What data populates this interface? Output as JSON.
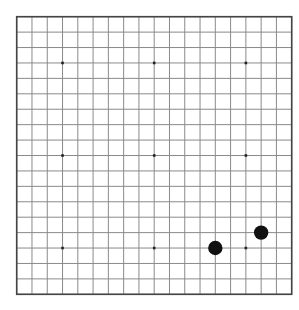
{
  "game": {
    "type": "go",
    "board_size": 19,
    "star_points": [
      [
        3,
        3
      ],
      [
        9,
        3
      ],
      [
        15,
        3
      ],
      [
        3,
        9
      ],
      [
        9,
        9
      ],
      [
        15,
        9
      ],
      [
        3,
        15
      ],
      [
        9,
        15
      ],
      [
        15,
        15
      ]
    ],
    "stones": [
      {
        "color": "black",
        "col": 13,
        "row": 15
      },
      {
        "color": "black",
        "col": 16,
        "row": 14
      }
    ]
  },
  "colors": {
    "background": "#ffffff",
    "grid_line": "#8a8a8a",
    "border": "#444444",
    "star_point": "#222222",
    "black_stone": "#111111"
  }
}
